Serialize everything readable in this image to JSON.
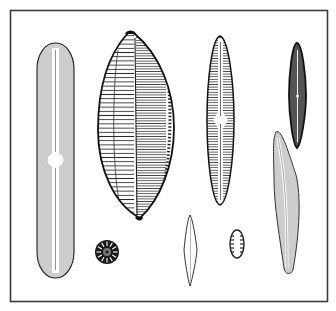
{
  "figure": {
    "background": "#ffffff",
    "frame": {
      "x": 10,
      "y": 10,
      "width": 318,
      "height": 292,
      "stroke": "#3a3a3a",
      "stroke_width": 1.6
    },
    "ink_color": "#1e1e1e",
    "specimens": [
      {
        "id": "A",
        "name": "long-rod-pennate-diatom",
        "cx": 55,
        "cy": 160,
        "length": 235,
        "width": 37
      },
      {
        "id": "B",
        "name": "large-boat-shaped-diatom",
        "cx": 136,
        "cy": 126,
        "length": 185,
        "width": 76
      },
      {
        "id": "C",
        "name": "narrow-navicula-diatom",
        "cx": 220,
        "cy": 120,
        "length": 169,
        "width": 27
      },
      {
        "id": "D",
        "name": "dark-lanceolate-diatom",
        "cx": 297,
        "cy": 95,
        "length": 105,
        "width": 17
      },
      {
        "id": "E",
        "name": "curved-cymbelloid-diatom",
        "cx": 287,
        "cy": 202,
        "length": 142,
        "width": 26
      },
      {
        "id": "F",
        "name": "centric-disc-diatom",
        "cx": 107,
        "cy": 252,
        "radius": 12,
        "rays": 20
      },
      {
        "id": "G",
        "name": "small-spindle-diatom",
        "cx": 190,
        "cy": 250,
        "length": 71,
        "width": 13
      },
      {
        "id": "H",
        "name": "small-oval-diatom",
        "cx": 237,
        "cy": 244,
        "rx": 7,
        "ry": 14
      }
    ]
  }
}
